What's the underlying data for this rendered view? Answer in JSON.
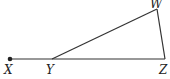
{
  "diagram": {
    "type": "geometry",
    "stroke_color": "#333333",
    "points": [
      {
        "id": "X",
        "label": "X",
        "x": 10,
        "y": 59,
        "lx": 4,
        "ly": 74,
        "dot": true
      },
      {
        "id": "Y",
        "label": "Y",
        "x": 52,
        "y": 59,
        "lx": 46,
        "ly": 74,
        "dot": false
      },
      {
        "id": "Z",
        "label": "Z",
        "x": 165,
        "y": 59,
        "lx": 159,
        "ly": 74,
        "dot": false
      },
      {
        "id": "W",
        "label": "W",
        "x": 157,
        "y": 9,
        "lx": 150,
        "ly": 8,
        "dot": false
      }
    ],
    "segments": [
      [
        "X",
        "Z"
      ],
      [
        "Y",
        "W"
      ],
      [
        "W",
        "Z"
      ]
    ]
  }
}
